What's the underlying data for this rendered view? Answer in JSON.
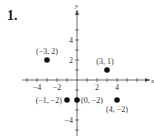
{
  "problem_number": "1.",
  "chart_data": {
    "type": "scatter",
    "title": "",
    "xlabel": "x",
    "ylabel": "y",
    "xlim": [
      -5,
      6
    ],
    "ylim": [
      -5,
      6
    ],
    "x_ticks": [
      -4,
      -2,
      2,
      4
    ],
    "y_ticks": [
      -4,
      2,
      4
    ],
    "grid": false,
    "points": [
      {
        "x": -3,
        "y": 2,
        "label": "(−3, 2)"
      },
      {
        "x": 3,
        "y": 1,
        "label": "(3, 1)"
      },
      {
        "x": -1,
        "y": -2,
        "label": "(−1, −2)"
      },
      {
        "x": 0,
        "y": -2,
        "label": "(0, −2)"
      },
      {
        "x": 4,
        "y": -2,
        "label": "(4, −2)"
      }
    ]
  }
}
